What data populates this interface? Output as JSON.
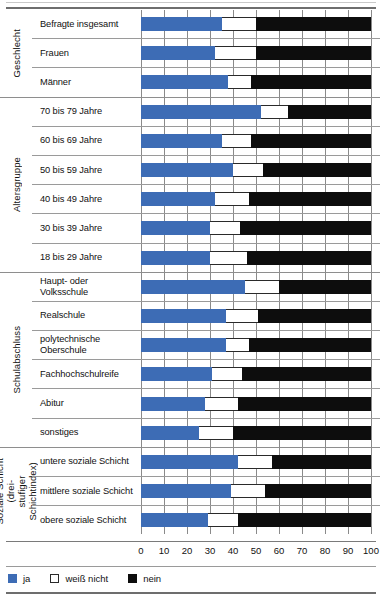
{
  "legend": {
    "position": "bottom-left",
    "items": [
      {
        "key": "ja",
        "label": "ja",
        "color": "#3d6cb5"
      },
      {
        "key": "weiss",
        "label": "weiß nicht",
        "color": "#ffffff"
      },
      {
        "key": "nein",
        "label": "nein",
        "color": "#0d0d0d"
      }
    ]
  },
  "axis": {
    "ticks": [
      "0",
      "10",
      "20",
      "30",
      "40",
      "50",
      "60",
      "70",
      "80",
      "90",
      "100"
    ]
  },
  "groups": [
    {
      "label": "Geschlecht",
      "rows": [
        {
          "label": "Befragte insgesamt"
        },
        {
          "label": "Frauen"
        },
        {
          "label": "Männer"
        }
      ]
    },
    {
      "label": "Altersgruppe",
      "rows": [
        {
          "label": "70 bis 79 Jahre"
        },
        {
          "label": "60 bis 69 Jahre"
        },
        {
          "label": "50 bis 59 Jahre"
        },
        {
          "label": "40 bis 49 Jahre"
        },
        {
          "label": "30 bis 39 Jahre"
        },
        {
          "label": "18 bis 29 Jahre"
        }
      ]
    },
    {
      "label": "Schulabschluss",
      "rows": [
        {
          "label": "Haupt- oder Volksschule"
        },
        {
          "label": "Realschule"
        },
        {
          "label": "polytechnische Oberschule"
        },
        {
          "label": "Fachhochschulreife"
        },
        {
          "label": "Abitur"
        },
        {
          "label": "sonstiges"
        }
      ]
    },
    {
      "label": "Soziale Schicht (drei-\nstufiger Schichtindex)",
      "rows": [
        {
          "label": "untere soziale Schicht"
        },
        {
          "label": "mittlere soziale Schicht"
        },
        {
          "label": "obere soziale Schicht"
        }
      ]
    }
  ],
  "chart_data": {
    "type": "bar",
    "orientation": "horizontal",
    "stacked": true,
    "normalized_percent": true,
    "title": "",
    "subtitle": "",
    "xlabel": "",
    "ylabel": "",
    "xlim": [
      0,
      100
    ],
    "xticks": [
      0,
      10,
      20,
      30,
      40,
      50,
      60,
      70,
      80,
      90,
      100
    ],
    "grid": true,
    "grid_axis": "x",
    "legend_position": "bottom-left",
    "categories": [
      "Befragte insgesamt",
      "Frauen",
      "Männer",
      "70 bis 79 Jahre",
      "60 bis 69 Jahre",
      "50 bis 59 Jahre",
      "40 bis 49 Jahre",
      "30 bis 39 Jahre",
      "18 bis 29 Jahre",
      "Haupt- oder Volksschule",
      "Realschule",
      "polytechnische Oberschule",
      "Fachhochschulreife",
      "Abitur",
      "sonstiges",
      "untere soziale Schicht",
      "mittlere soziale Schicht",
      "obere soziale Schicht"
    ],
    "category_groups": [
      {
        "name": "Geschlecht",
        "categories": [
          "Befragte insgesamt",
          "Frauen",
          "Männer"
        ]
      },
      {
        "name": "Altersgruppe",
        "categories": [
          "70 bis 79 Jahre",
          "60 bis 69 Jahre",
          "50 bis 59 Jahre",
          "40 bis 49 Jahre",
          "30 bis 39 Jahre",
          "18 bis 29 Jahre"
        ]
      },
      {
        "name": "Schulabschluss",
        "categories": [
          "Haupt- oder Volksschule",
          "Realschule",
          "polytechnische Oberschule",
          "Fachhochschulreife",
          "Abitur",
          "sonstiges"
        ]
      },
      {
        "name": "Soziale Schicht (drei-stufiger Schichtindex)",
        "categories": [
          "untere soziale Schicht",
          "mittlere soziale Schicht",
          "obere soziale Schicht"
        ]
      }
    ],
    "series": [
      {
        "name": "ja",
        "color": "#3d6cb5",
        "values": [
          35,
          32,
          38,
          52,
          35,
          40,
          32,
          30,
          30,
          45,
          37,
          37,
          31,
          28,
          25,
          42,
          39,
          29
        ]
      },
      {
        "name": "weiß nicht",
        "color": "#ffffff",
        "values": [
          15,
          18,
          10,
          12,
          13,
          13,
          15,
          13,
          16,
          15,
          14,
          10,
          13,
          14,
          15,
          15,
          15,
          13
        ]
      },
      {
        "name": "nein",
        "color": "#0d0d0d",
        "values": [
          50,
          50,
          52,
          36,
          52,
          47,
          53,
          57,
          54,
          40,
          49,
          53,
          56,
          58,
          60,
          43,
          46,
          58
        ]
      }
    ]
  }
}
